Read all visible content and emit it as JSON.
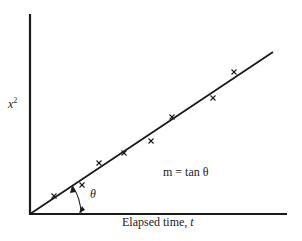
{
  "figure": {
    "colors": {
      "ink": "#1a1a1a",
      "background": "#ffffff"
    },
    "axes": {
      "y_label_var": "x",
      "y_label_exp": "2",
      "x_label_text": "Elapsed time, ",
      "x_label_var": "t"
    },
    "annotations": {
      "angle_symbol": "θ",
      "slope_equation": "m = tan θ"
    },
    "fit_line": {
      "from": [
        30,
        214
      ],
      "to": [
        273,
        52
      ]
    },
    "data_points": [
      [
        54,
        196
      ],
      [
        82,
        185
      ],
      [
        99,
        163
      ],
      [
        124,
        153
      ],
      [
        151,
        141
      ],
      [
        172,
        117
      ],
      [
        213,
        98
      ],
      [
        234,
        72
      ]
    ]
  }
}
